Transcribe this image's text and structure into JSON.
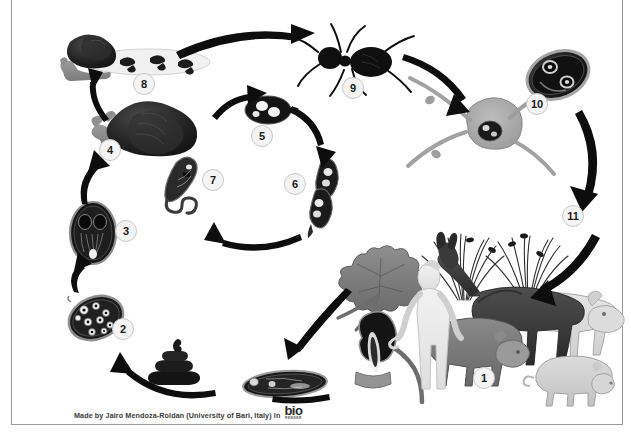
{
  "document": {
    "title": "Dicrocoelium dendriticum life cycle",
    "background_color": "#ffffff",
    "frame_color": "#9a9a9a"
  },
  "credit": {
    "text": "Made by Jairo Mendoza-Roldan (University of Bari, Italy) in",
    "logo_main": "bio",
    "logo_sub": "RENDER"
  },
  "stages": [
    {
      "number": "1",
      "name": "definitive-hosts-grazing-animals",
      "x": 484,
      "y": 378
    },
    {
      "number": "2",
      "name": "egg-with-miracidium",
      "x": 123,
      "y": 329
    },
    {
      "number": "3",
      "name": "miracidium-hatched",
      "x": 126,
      "y": 231
    },
    {
      "number": "4",
      "name": "first-intermediate-host-land-snail",
      "x": 110,
      "y": 150
    },
    {
      "number": "5",
      "name": "sporocyst",
      "x": 262,
      "y": 136
    },
    {
      "number": "6",
      "name": "redia",
      "x": 295,
      "y": 184
    },
    {
      "number": "7",
      "name": "cercaria",
      "x": 213,
      "y": 180
    },
    {
      "number": "8",
      "name": "slime-ball-cercariae",
      "x": 144,
      "y": 84
    },
    {
      "number": "9",
      "name": "second-intermediate-host-ant",
      "x": 353,
      "y": 88
    },
    {
      "number": "10",
      "name": "metacercaria-in-ant-brain",
      "x": 537,
      "y": 104
    },
    {
      "number": "11",
      "name": "infected-ant-on-grass",
      "x": 573,
      "y": 216
    }
  ],
  "illustrations": [
    {
      "name": "snail-with-slime-trail",
      "label": "Land snail excreting slime ball with cercariae"
    },
    {
      "name": "land-snail",
      "label": "Land snail first intermediate host"
    },
    {
      "name": "sporocyst-illustration",
      "label": "Sporocyst stage"
    },
    {
      "name": "redia-illustration",
      "label": "Redia stage"
    },
    {
      "name": "cercaria-illustration",
      "label": "Cercaria with tail"
    },
    {
      "name": "miracidium-illustration",
      "label": "Miracidium"
    },
    {
      "name": "egg-illustration",
      "label": "Egg containing miracidium"
    },
    {
      "name": "feces-illustration",
      "label": "Feces containing eggs"
    },
    {
      "name": "adult-fluke-illustration",
      "label": "Adult Dicrocoelium fluke"
    },
    {
      "name": "liver-gallbladder-illustration",
      "label": "Liver with bile duct and gallbladder"
    },
    {
      "name": "ant-illustration",
      "label": "Ant second intermediate host"
    },
    {
      "name": "ant-brain-metacercaria-illustration",
      "label": "Metacercaria encysted in ant brain"
    },
    {
      "name": "grass-illustration",
      "label": "Grass blades with attached infected ants"
    },
    {
      "name": "human-illustration",
      "label": "Human accidental host"
    },
    {
      "name": "horse-illustration",
      "label": "Horse definitive host"
    },
    {
      "name": "cow-illustration",
      "label": "Cow definitive host"
    },
    {
      "name": "sheep-illustration",
      "label": "Sheep definitive host"
    },
    {
      "name": "pig-illustration",
      "label": "Pig definitive host"
    }
  ],
  "arrows": [
    {
      "name": "arrow-snail-to-slimeball"
    },
    {
      "name": "arrow-miracidium-to-snail"
    },
    {
      "name": "arrow-snail-to-sporocyst"
    },
    {
      "name": "arrow-sporocyst-to-redia"
    },
    {
      "name": "arrow-redia-to-cercaria"
    },
    {
      "name": "arrow-cercaria-to-snail-surface"
    },
    {
      "name": "arrow-slimeball-to-ant"
    },
    {
      "name": "arrow-ant-to-brain"
    },
    {
      "name": "arrow-brain-to-grass"
    },
    {
      "name": "arrow-grass-to-hosts"
    },
    {
      "name": "arrow-hosts-to-adult-fluke"
    },
    {
      "name": "arrow-feces-to-egg"
    },
    {
      "name": "arrow-egg-to-miracidium"
    }
  ],
  "colors": {
    "ink": "#111111",
    "mid_gray": "#8d8d8d",
    "light_gray": "#c9c9c9",
    "badge_fill": "#f4f4f4",
    "badge_border": "#c9c9c9"
  }
}
